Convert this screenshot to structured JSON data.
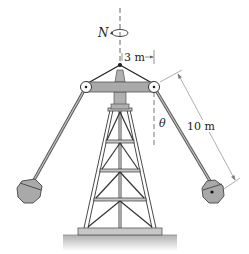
{
  "figure": {
    "labels": {
      "rotation": "N",
      "arm_offset": "3 m",
      "angle": "θ",
      "arm_length": "10 m"
    },
    "colors": {
      "line": "#222222",
      "fill_gray": "#a9a9a9",
      "fill_light": "#c8c8c8",
      "ground": "#b5b5b5",
      "dashed": "#555555",
      "dimension": "#666666"
    }
  }
}
